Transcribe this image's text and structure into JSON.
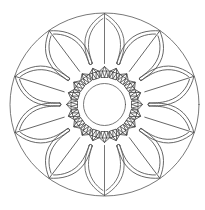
{
  "image": {
    "title": "Mandala coloring page",
    "description": "Black line-art mandala: outer circle, ten pointed double-outlined petals with center veins, a ring of faceted gem shapes, and a plain inner circle.",
    "stroke_color": "#555555",
    "background_color": "#ffffff"
  },
  "mandala": {
    "center": [
      104.5,
      104.5
    ],
    "outer_circle": {
      "rx": 94.5,
      "ry": 91.5
    },
    "petals": {
      "count": 10,
      "start_angle_deg": -90,
      "step_deg": 36
    },
    "gem_ring": {
      "count": 20,
      "radius": 32,
      "gem_size": 10
    },
    "inner_circle": {
      "radius": 21
    }
  }
}
